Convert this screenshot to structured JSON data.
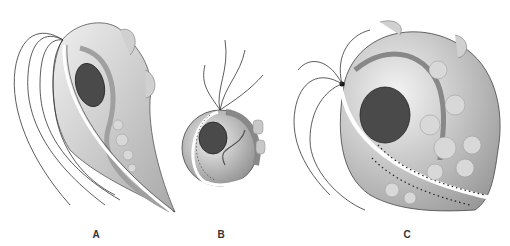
{
  "figure": {
    "panels": [
      {
        "id": "A",
        "label": "A",
        "label_x": 96,
        "label_y": 229,
        "subject": "trophozoite-pear-shaped"
      },
      {
        "id": "B",
        "label": "B",
        "label_x": 221,
        "label_y": 229,
        "subject": "trophozoite-rounded"
      },
      {
        "id": "C",
        "label": "C",
        "label_x": 407,
        "label_y": 229,
        "subject": "trophozoite-amoeboid-large"
      }
    ],
    "colors": {
      "background": "#ffffff",
      "cell_light": "#e4e4e4",
      "cell_mid": "#bdbdbd",
      "cell_dark": "#8f8f8f",
      "nucleus": "#4a4a4a",
      "nucleus_detail": "#222222",
      "outline": "#333333",
      "undulating_membrane": "#ffffff",
      "label": "#333333"
    }
  }
}
